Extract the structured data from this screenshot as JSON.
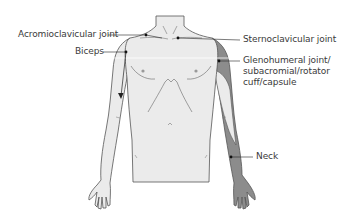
{
  "diagram": {
    "type": "anatomical referral-pain diagram (anterior view, upper body)",
    "colors": {
      "skin_fill": "#ebebeb",
      "outline": "#555555",
      "shaded_region": "#8c8c8c",
      "label_text": "#3a3a3a",
      "leader_line": "#222222"
    },
    "labels": [
      {
        "id": "acromioclavicular",
        "text": "Acromioclavicular joint"
      },
      {
        "id": "biceps",
        "text": "Biceps"
      },
      {
        "id": "sternoclavicular",
        "text": "Sternoclavicular joint"
      },
      {
        "id": "glenohumeral",
        "text": "Glenohumeral joint/ subacromial/rotator cuff/capsule"
      },
      {
        "id": "neck",
        "text": "Neck"
      }
    ],
    "annotations": {
      "biceps_arrow": "arrow from upper arm pointing down the arm",
      "shaded_area": "right shoulder down the lateral arm to the hand (referral pattern)"
    }
  }
}
